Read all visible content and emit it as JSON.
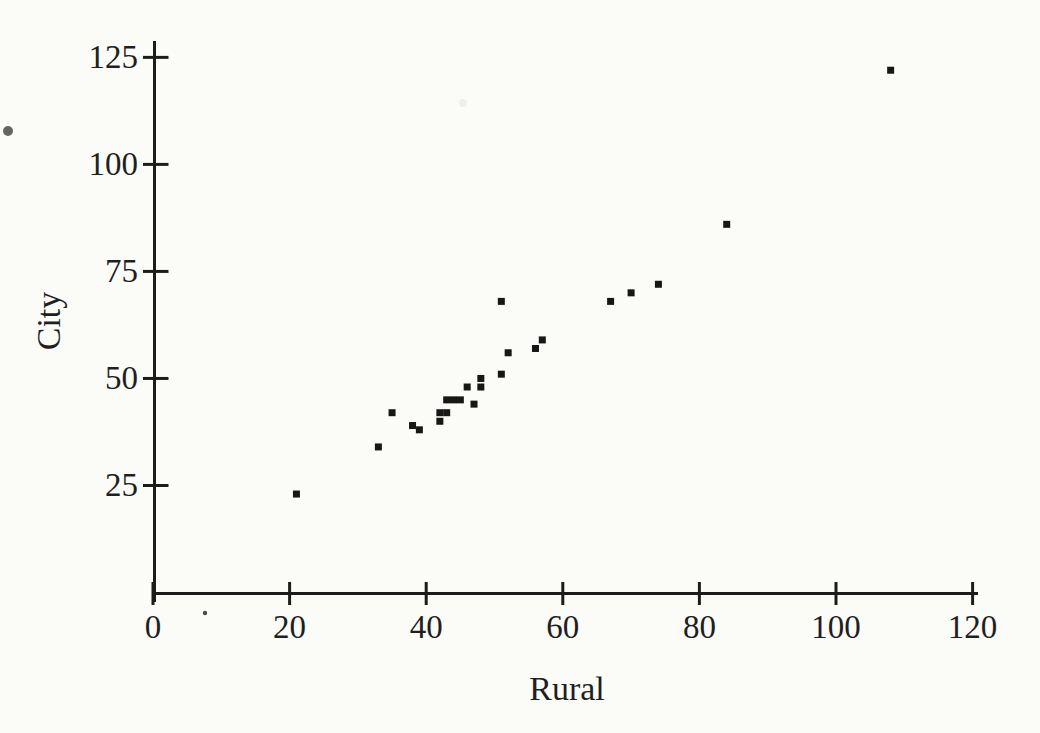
{
  "chart_data": {
    "type": "scatter",
    "title": "",
    "xlabel": "Rural",
    "ylabel": "City",
    "x_ticks": [
      0,
      20,
      40,
      60,
      80,
      100,
      120
    ],
    "y_ticks": [
      25,
      50,
      75,
      100,
      125
    ],
    "xlim": [
      0,
      121
    ],
    "ylim": [
      0,
      129
    ],
    "grid": false,
    "legend": "none",
    "marker_shape": "filled-square",
    "points": [
      [
        21,
        23
      ],
      [
        33,
        34
      ],
      [
        35,
        42
      ],
      [
        38,
        39
      ],
      [
        39,
        38
      ],
      [
        42,
        42
      ],
      [
        42,
        40
      ],
      [
        43,
        45
      ],
      [
        43,
        42
      ],
      [
        44,
        45
      ],
      [
        45,
        45
      ],
      [
        46,
        48
      ],
      [
        47,
        44
      ],
      [
        48,
        50
      ],
      [
        48,
        48
      ],
      [
        51,
        68
      ],
      [
        51,
        51
      ],
      [
        52,
        56
      ],
      [
        56,
        57
      ],
      [
        57,
        59
      ],
      [
        67,
        68
      ],
      [
        70,
        70
      ],
      [
        74,
        72
      ],
      [
        84,
        86
      ],
      [
        108,
        122
      ]
    ]
  },
  "style": {
    "paper_color": "#fbfbf8",
    "text_color": "#1f1f1f",
    "axis_color": "#1c1c1c",
    "marker_color": "#171717"
  }
}
